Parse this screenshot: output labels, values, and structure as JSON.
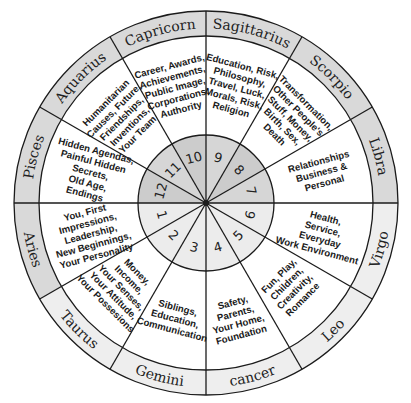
{
  "diagram": {
    "colors": {
      "band_dark": "#d9d9d9",
      "band_light": "#eeeeee",
      "inner_upper": "#d6d6d6",
      "inner_upper_dark": "#cccccc",
      "inner_lower": "#ececec",
      "line": "#1b1b1b",
      "background": "#ffffff"
    },
    "houses": [
      {
        "number": "1",
        "sign": "Aries",
        "lines": [
          "You, First",
          "Impressions,",
          "Leadership,",
          "New Beginnings,",
          "Your Personality"
        ]
      },
      {
        "number": "2",
        "sign": "Taurus",
        "lines": [
          "Money,",
          "Income,",
          "Your Senses,",
          "Your Attitude,",
          "Your Possesions"
        ]
      },
      {
        "number": "3",
        "sign": "Gemini",
        "lines": [
          "Siblings,",
          "Education,",
          "Communication"
        ]
      },
      {
        "number": "4",
        "sign": "cancer",
        "lines": [
          "Safety,",
          "Parents,",
          "Your Home,",
          "Foundation"
        ]
      },
      {
        "number": "5",
        "sign": "Leo",
        "lines": [
          "Fun, Play,",
          "Children,",
          "Creativity,",
          "Romance"
        ]
      },
      {
        "number": "6",
        "sign": "Virgo",
        "lines": [
          "Health,",
          "Service,",
          "Everyday",
          "Work Environment"
        ]
      },
      {
        "number": "7",
        "sign": "Libra",
        "lines": [
          "Relationships",
          "Business &",
          "Personal"
        ]
      },
      {
        "number": "8",
        "sign": "Scorpio",
        "lines": [
          "Transformation,",
          "Other People's",
          "Stuff, Money,",
          "Birth, Sex,",
          "Death"
        ]
      },
      {
        "number": "9",
        "sign": "Sagittarius",
        "lines": [
          "Education, Risk,",
          "Philosophy,",
          "Travel, Luck,",
          "Morals, Risk,",
          "Religion"
        ]
      },
      {
        "number": "10",
        "sign": "Capricorn",
        "lines": [
          "Career, Awards,",
          "Achievements,",
          "Public Image,",
          "Corporations,",
          "Authority"
        ]
      },
      {
        "number": "11",
        "sign": "Aquarius",
        "lines": [
          "Humanitarian",
          "Causes, Future,",
          "Friendships,",
          "Inventions,",
          "Your Team"
        ]
      },
      {
        "number": "12",
        "sign": "Pisces",
        "lines": [
          "Hidden Agendas,",
          "Painful Hidden",
          "Secrets,",
          "Old Age,",
          "Endings"
        ]
      }
    ]
  }
}
